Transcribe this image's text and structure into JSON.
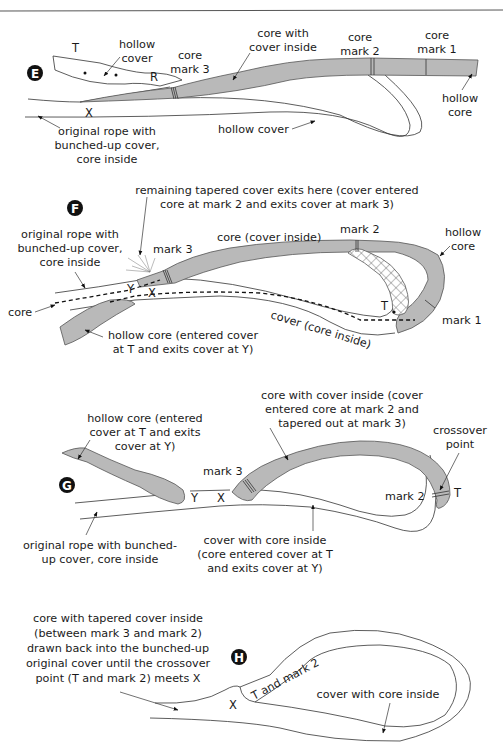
{
  "figure": {
    "header_rule": true,
    "panels": [
      {
        "id": "E",
        "badge": "E",
        "labels": {
          "hollow_cover_top": [
            "hollow",
            "cover"
          ],
          "core_mark_3": [
            "core",
            "mark 3"
          ],
          "core_with_cover_inside": [
            "core with",
            "cover inside"
          ],
          "core_mark_2": [
            "core",
            "mark 2"
          ],
          "core_mark_1": [
            "core",
            "mark 1"
          ],
          "hollow_core": [
            "hollow",
            "core"
          ],
          "hollow_cover_bottom": "hollow cover",
          "original_rope": [
            "original rope with",
            "bunched-up cover,",
            "core inside"
          ]
        },
        "letters": {
          "T": "T",
          "R": "R",
          "X": "X"
        }
      },
      {
        "id": "F",
        "badge": "F",
        "labels": {
          "remaining_tapered": [
            "remaining tapered cover exits here (cover entered",
            "core at mark 2 and exits cover at mark 3)"
          ],
          "original_rope": [
            "original rope with",
            "bunched-up cover,",
            "core inside"
          ],
          "mark_3": "mark 3",
          "core_cover_inside": "core (cover inside)",
          "mark_2": "mark 2",
          "hollow_core": [
            "hollow",
            "core"
          ],
          "core": "core",
          "mark_1": "mark 1",
          "cover_core_inside": "cover (core inside)",
          "hollow_core_entered": [
            "hollow core (entered cover",
            "at T and exits cover at Y)"
          ]
        },
        "letters": {
          "Y": "Y",
          "X": "X",
          "T": "T"
        }
      },
      {
        "id": "G",
        "badge": "G",
        "labels": {
          "hollow_core_entered": [
            "hollow core (entered",
            "cover at T and exits",
            "cover at Y)"
          ],
          "core_with_cover_inside": [
            "core with cover inside (cover",
            "entered core at mark 2 and",
            "tapered out at mark 3)"
          ],
          "crossover_point": [
            "crossover",
            "point"
          ],
          "mark_3": "mark 3",
          "mark_2": "mark 2",
          "original_rope": [
            "original rope with bunched-",
            "up cover, core inside"
          ],
          "cover_with_core_inside": [
            "cover with core inside",
            "(core entered cover at T",
            "and exits cover at Y)"
          ]
        },
        "letters": {
          "Y": "Y",
          "X": "X",
          "T": "T"
        }
      },
      {
        "id": "H",
        "badge": "H",
        "labels": {
          "core_tapered": [
            "core with tapered cover inside",
            "(between mark 3 and mark 2)",
            "drawn back into the bunched-up",
            "original cover until the crossover",
            "point (T and mark 2) meets X"
          ],
          "t_and_mark_2": "T and mark 2",
          "cover_with_core_inside": "cover with core inside"
        },
        "letters": {
          "X": "X"
        }
      }
    ]
  },
  "colors": {
    "core_fill": "#b9b9b9",
    "outline": "#333333",
    "badge": "#111111",
    "background": "#ffffff"
  }
}
